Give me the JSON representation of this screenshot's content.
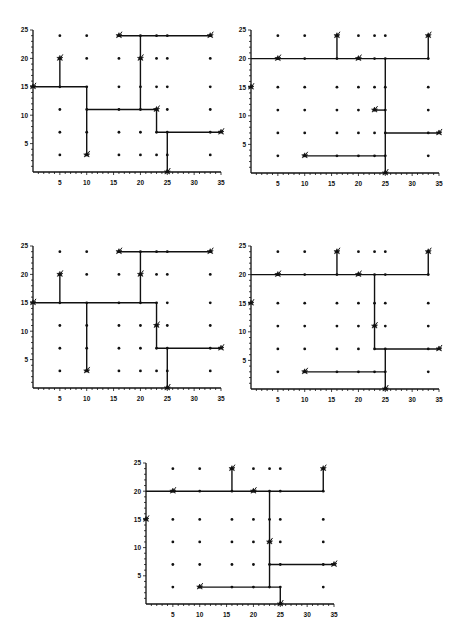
{
  "figure": {
    "axes": {
      "x_range": [
        0,
        35
      ],
      "y_range": [
        0,
        25
      ],
      "x_ticks": [
        "5",
        "10",
        "15",
        "20",
        "25",
        "30",
        "35"
      ],
      "y_ticks": [
        "5",
        "10",
        "15",
        "20",
        "25"
      ]
    },
    "terminals": [
      [
        0,
        15
      ],
      [
        5,
        20
      ],
      [
        10,
        3
      ],
      [
        16,
        24
      ],
      [
        20,
        20
      ],
      [
        23,
        11
      ],
      [
        33,
        24
      ],
      [
        35,
        7
      ],
      [
        25,
        0
      ]
    ],
    "grid_x": [
      5,
      10,
      16,
      20,
      23,
      25,
      33
    ],
    "grid_y": [
      3,
      7,
      11,
      15,
      20,
      24
    ],
    "colors": {
      "line": "#111111",
      "point": "#111111",
      "background": "#ffffff"
    }
  },
  "panels": [
    {
      "id": "top-left",
      "frame": {
        "x0": 33,
        "y0": 172,
        "x1": 221,
        "y1": 30
      },
      "edges": [
        [
          [
            0,
            15
          ],
          [
            10,
            15
          ]
        ],
        [
          [
            5,
            15
          ],
          [
            5,
            20
          ]
        ],
        [
          [
            10,
            15
          ],
          [
            10,
            3
          ]
        ],
        [
          [
            10,
            11
          ],
          [
            23,
            11
          ]
        ],
        [
          [
            20,
            11
          ],
          [
            20,
            24
          ]
        ],
        [
          [
            16,
            24
          ],
          [
            33,
            24
          ]
        ],
        [
          [
            23,
            11
          ],
          [
            23,
            7
          ]
        ],
        [
          [
            23,
            7
          ],
          [
            35,
            7
          ]
        ],
        [
          [
            25,
            7
          ],
          [
            25,
            0
          ]
        ]
      ]
    },
    {
      "id": "top-right",
      "frame": {
        "x0": 251,
        "y0": 173,
        "x1": 439,
        "y1": 30
      },
      "edges": [
        [
          [
            0,
            20
          ],
          [
            33,
            20
          ]
        ],
        [
          [
            16,
            20
          ],
          [
            16,
            24
          ]
        ],
        [
          [
            33,
            20
          ],
          [
            33,
            24
          ]
        ],
        [
          [
            25,
            20
          ],
          [
            25,
            0
          ]
        ],
        [
          [
            23,
            11
          ],
          [
            25,
            11
          ]
        ],
        [
          [
            25,
            7
          ],
          [
            35,
            7
          ]
        ],
        [
          [
            10,
            3
          ],
          [
            25,
            3
          ]
        ]
      ]
    },
    {
      "id": "middle-left",
      "frame": {
        "x0": 33,
        "y0": 388,
        "x1": 221,
        "y1": 246
      },
      "edges": [
        [
          [
            0,
            15
          ],
          [
            23,
            15
          ]
        ],
        [
          [
            5,
            15
          ],
          [
            5,
            20
          ]
        ],
        [
          [
            10,
            15
          ],
          [
            10,
            3
          ]
        ],
        [
          [
            20,
            15
          ],
          [
            20,
            24
          ]
        ],
        [
          [
            16,
            24
          ],
          [
            33,
            24
          ]
        ],
        [
          [
            23,
            15
          ],
          [
            23,
            7
          ]
        ],
        [
          [
            23,
            7
          ],
          [
            35,
            7
          ]
        ],
        [
          [
            25,
            7
          ],
          [
            25,
            0
          ]
        ]
      ]
    },
    {
      "id": "middle-right",
      "frame": {
        "x0": 251,
        "y0": 389,
        "x1": 439,
        "y1": 246
      },
      "edges": [
        [
          [
            0,
            20
          ],
          [
            33,
            20
          ]
        ],
        [
          [
            16,
            20
          ],
          [
            16,
            24
          ]
        ],
        [
          [
            33,
            20
          ],
          [
            33,
            24
          ]
        ],
        [
          [
            23,
            20
          ],
          [
            23,
            7
          ]
        ],
        [
          [
            23,
            7
          ],
          [
            35,
            7
          ]
        ],
        [
          [
            25,
            7
          ],
          [
            25,
            0
          ]
        ],
        [
          [
            10,
            3
          ],
          [
            25,
            3
          ]
        ]
      ]
    },
    {
      "id": "bottom",
      "frame": {
        "x0": 146,
        "y0": 604,
        "x1": 334,
        "y1": 463
      },
      "edges": [
        [
          [
            0,
            20
          ],
          [
            33,
            20
          ]
        ],
        [
          [
            16,
            20
          ],
          [
            16,
            24
          ]
        ],
        [
          [
            33,
            20
          ],
          [
            33,
            24
          ]
        ],
        [
          [
            23,
            20
          ],
          [
            23,
            3
          ]
        ],
        [
          [
            23,
            7
          ],
          [
            35,
            7
          ]
        ],
        [
          [
            10,
            3
          ],
          [
            25,
            3
          ]
        ],
        [
          [
            25,
            3
          ],
          [
            25,
            0
          ]
        ]
      ]
    }
  ]
}
